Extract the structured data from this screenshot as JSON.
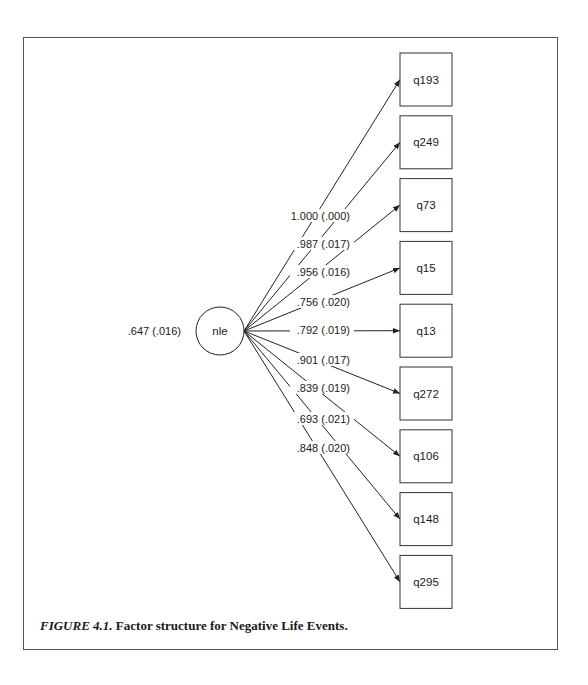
{
  "figure": {
    "number": "FIGURE 4.1.",
    "caption": "Factor structure for Negative Life Events."
  },
  "latent": {
    "name": "nle",
    "variance": ".647 (.016)"
  },
  "indicators": [
    {
      "name": "q193",
      "loading": "1.000 (.000)"
    },
    {
      "name": "q249",
      "loading": ".987 (.017)"
    },
    {
      "name": "q73",
      "loading": ".956 (.016)"
    },
    {
      "name": "q15",
      "loading": ".756 (.020)"
    },
    {
      "name": "q13",
      "loading": ".792 (.019)"
    },
    {
      "name": "q272",
      "loading": ".901 (.017)"
    },
    {
      "name": "q106",
      "loading": ".839 (.019)"
    },
    {
      "name": "q148",
      "loading": ".693 (.021)"
    },
    {
      "name": "q295",
      "loading": ".848 (.020)"
    }
  ],
  "colors": {
    "line": "#222222",
    "frame": "#555555"
  }
}
